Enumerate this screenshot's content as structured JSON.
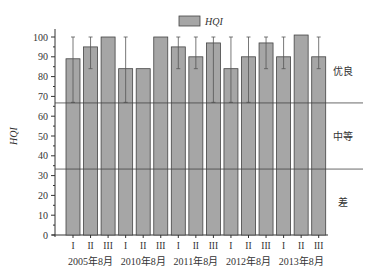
{
  "chart_data": {
    "type": "bar",
    "title": "",
    "legend": {
      "label": "HQI",
      "position": "top-center",
      "swatch_color": "#a6a6a6"
    },
    "xlabel": "",
    "ylabel": "HQI",
    "ylim": [
      0,
      100
    ],
    "yticks": [
      0,
      10,
      20,
      30,
      40,
      50,
      60,
      70,
      80,
      90,
      100
    ],
    "grid": false,
    "categories": [
      "I",
      "II",
      "III",
      "I",
      "II",
      "III",
      "I",
      "II",
      "III",
      "I",
      "II",
      "III",
      "I",
      "II",
      "III"
    ],
    "groups": [
      "2005年8月",
      "2010年8月",
      "2011年8月",
      "2012年8月",
      "2013年8月"
    ],
    "series": [
      {
        "name": "HQI",
        "values": [
          89,
          95,
          100,
          84,
          84,
          100,
          95,
          90,
          97,
          84,
          90,
          97,
          90,
          101,
          90
        ],
        "error_low": [
          67,
          84,
          null,
          67,
          null,
          null,
          84,
          84,
          67,
          67,
          67,
          84,
          84,
          null,
          84
        ],
        "error_high": [
          100,
          100,
          null,
          100,
          null,
          null,
          100,
          100,
          100,
          100,
          100,
          100,
          100,
          null,
          100
        ]
      }
    ],
    "thresholds": [
      {
        "value": 66.7,
        "label_above": "优良"
      },
      {
        "value": 33.3,
        "label_above": "中等",
        "label_below": "差"
      }
    ],
    "zone_labels": [
      "优良",
      "中等",
      "差"
    ],
    "colors": {
      "bar": "#a6a6a6",
      "bar_edge": "#444444",
      "axis": "#333333"
    }
  }
}
